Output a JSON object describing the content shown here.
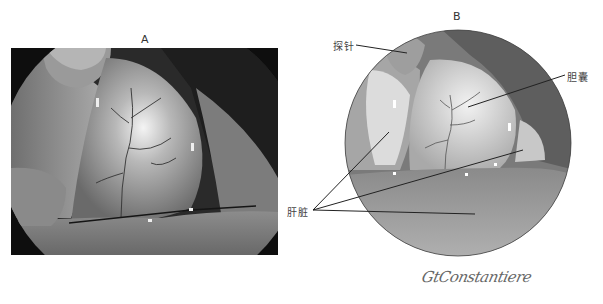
{
  "figure": {
    "panels": [
      {
        "id": "A",
        "label": "A",
        "type": "laparoscopic-photograph"
      },
      {
        "id": "B",
        "label": "B",
        "type": "medical-illustration"
      }
    ],
    "annotations": {
      "probe": "探针",
      "gallbladder": "胆囊",
      "liver": "肝脏"
    },
    "signature": "GtConstantiere"
  },
  "colors": {
    "background": "#ffffff",
    "photo_dark": "#111111",
    "leader_line": "#222222"
  }
}
